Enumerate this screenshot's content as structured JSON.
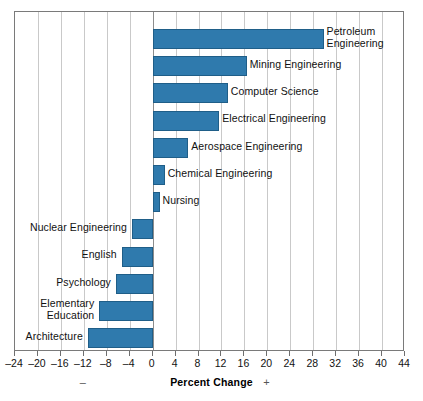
{
  "chart_data": {
    "type": "bar",
    "orientation": "horizontal",
    "title": "",
    "xlabel": "Percent Change",
    "ylabel": "",
    "xlim": [
      -24,
      44
    ],
    "xticks": [
      -24,
      -20,
      -16,
      -12,
      -8,
      -4,
      0,
      4,
      8,
      12,
      16,
      20,
      24,
      28,
      32,
      36,
      40,
      44
    ],
    "xticklabels": [
      "–24",
      "–20",
      "–16",
      "–12",
      "–8",
      "–4",
      "0",
      "4",
      "8",
      "12",
      "16",
      "20",
      "24",
      "28",
      "32",
      "36",
      "40",
      "44"
    ],
    "grid": true,
    "grid_axis": "x",
    "legend": "none",
    "bar_color": "#2f7aad",
    "bar_edge_color": "#1f5e88",
    "categories": [
      "Petroleum Engineering",
      "Mining Engineering",
      "Computer Science",
      "Electrical Engineering",
      "Aerospace Engineering",
      "Chemical Engineering",
      "Nursing",
      "Nuclear Engineering",
      "English",
      "Psychology",
      "Elementary Education",
      "Architecture"
    ],
    "values": [
      29.8,
      16.4,
      13.1,
      11.6,
      6.2,
      2.1,
      1.2,
      -3.6,
      -5.4,
      -6.4,
      -9.3,
      -11.3
    ],
    "annotations": {
      "negative_sign": "–",
      "positive_sign": "+"
    }
  },
  "bars": [
    {
      "label": "Petroleum\nEngineering",
      "value": 29.8
    },
    {
      "label": "Mining Engineering",
      "value": 16.4
    },
    {
      "label": "Computer Science",
      "value": 13.1
    },
    {
      "label": "Electrical Engineering",
      "value": 11.6
    },
    {
      "label": "Aerospace Engineering",
      "value": 6.2
    },
    {
      "label": "Chemical Engineering",
      "value": 2.1
    },
    {
      "label": "Nursing",
      "value": 1.2
    },
    {
      "label": "Nuclear Engineering",
      "value": -3.6
    },
    {
      "label": "English",
      "value": -5.4
    },
    {
      "label": "Psychology",
      "value": -6.4
    },
    {
      "label": "Elementary\nEducation",
      "value": -9.3
    },
    {
      "label": "Architecture",
      "value": -11.3
    }
  ]
}
